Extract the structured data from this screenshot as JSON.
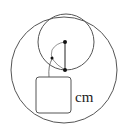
{
  "diagram": {
    "unit_label": "cm",
    "stroke_color": "#555555",
    "dot_color": "#111111",
    "outer_circle": {
      "cx": 64,
      "cy": 70,
      "r": 53
    },
    "inner_circle": {
      "cx": 66,
      "cy": 42,
      "r": 28
    },
    "points": [
      {
        "name": "inner-center",
        "x": 65,
        "y": 42
      },
      {
        "name": "tangent-point",
        "x": 65,
        "y": 70
      },
      {
        "name": "arc-point",
        "x": 52,
        "y": 58
      }
    ],
    "answer_box": {
      "x": 36,
      "y": 77,
      "w": 35,
      "h": 36
    }
  }
}
